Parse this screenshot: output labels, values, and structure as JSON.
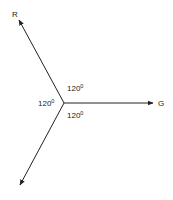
{
  "diagram": {
    "type": "phasor-diagram",
    "center": [
      64,
      103
    ],
    "vectors": [
      {
        "name": "R",
        "label": "R",
        "tip": [
          19,
          20
        ],
        "label_pos": [
          12,
          17
        ]
      },
      {
        "name": "G",
        "label": "G",
        "tip": [
          153,
          103
        ],
        "label_pos": [
          158,
          106
        ]
      },
      {
        "name": "B",
        "label": "",
        "tip": [
          20,
          185
        ],
        "label_pos": [
          0,
          0
        ]
      }
    ],
    "angles": [
      {
        "value": "120",
        "unit": "0",
        "pos": [
          67,
          91
        ]
      },
      {
        "value": "120",
        "unit": "0",
        "pos": [
          38,
          106
        ]
      },
      {
        "value": "120",
        "unit": "0",
        "pos": [
          67,
          118
        ]
      }
    ],
    "stroke_color": "#222222"
  }
}
